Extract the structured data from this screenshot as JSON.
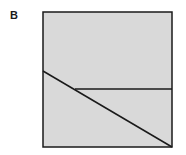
{
  "panel": {
    "label": "B"
  },
  "diagram": {
    "box": {
      "x": 43,
      "y": 12,
      "width": 129,
      "height": 135,
      "fill": "#d9d9d9",
      "stroke": "#1a1a1a"
    },
    "lines": [
      {
        "name": "diagonal-line",
        "x1": 43,
        "y1": 71,
        "x2": 172,
        "y2": 147
      },
      {
        "name": "horizontal-line",
        "x1": 75,
        "y1": 89,
        "x2": 172,
        "y2": 89
      }
    ]
  }
}
